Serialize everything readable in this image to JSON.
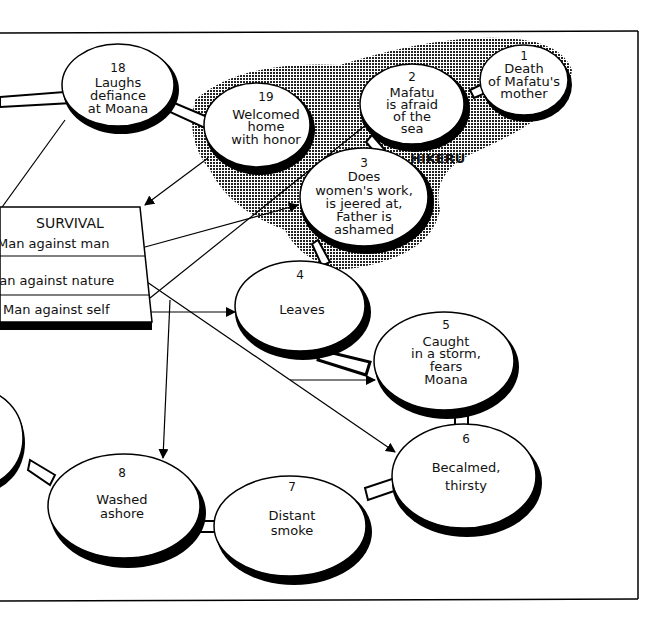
{
  "diagram": {
    "type": "plot-map",
    "region_label": "HIKERU",
    "survival_box": {
      "title": "SURVIVAL",
      "rows": [
        "Man against man",
        "Man against nature",
        "Man against self"
      ]
    },
    "nodes": [
      {
        "num": "1",
        "lines": [
          "Death",
          "of Mafatu's",
          "mother"
        ]
      },
      {
        "num": "2",
        "lines": [
          "Mafatu",
          "is afraid",
          "of the",
          "sea"
        ]
      },
      {
        "num": "3",
        "lines": [
          "Does",
          "women's work,",
          "is jeered at,",
          "Father is",
          "ashamed"
        ]
      },
      {
        "num": "4",
        "lines": [
          "Leaves"
        ]
      },
      {
        "num": "5",
        "lines": [
          "Caught",
          "in a storm,",
          "fears",
          "Moana"
        ]
      },
      {
        "num": "6",
        "lines": [
          "Becalmed,",
          "thirsty"
        ]
      },
      {
        "num": "7",
        "lines": [
          "Distant",
          "smoke"
        ]
      },
      {
        "num": "8",
        "lines": [
          "Washed",
          "ashore"
        ]
      },
      {
        "num": "18",
        "lines": [
          "Laughs",
          "defiance",
          "at Moana"
        ]
      },
      {
        "num": "19",
        "lines": [
          "Welcomed",
          "home",
          "with honor"
        ]
      }
    ]
  }
}
